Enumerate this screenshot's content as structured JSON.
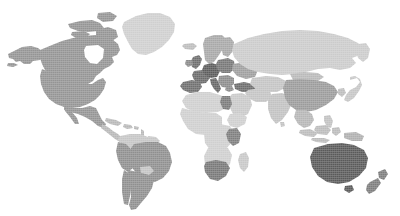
{
  "map": {
    "title": "",
    "projection": "equirectangular",
    "background_color": "#ffffff",
    "texture": "halftone-dither",
    "legend_visible": false,
    "labels_visible": false,
    "border_color": "none",
    "shade_levels": [
      {
        "key": "none",
        "color": "#ffffff",
        "label": "no data"
      },
      {
        "key": "light",
        "color": "#d2d2d2",
        "label": "lowest"
      },
      {
        "key": "medium",
        "color": "#b4b4b4",
        "label": "low"
      },
      {
        "key": "mid_dark",
        "color": "#969696",
        "label": "medium"
      },
      {
        "key": "dark",
        "color": "#7a7a7a",
        "label": "high"
      },
      {
        "key": "darkest",
        "color": "#5e5e5e",
        "label": "highest"
      }
    ],
    "regions": [
      {
        "name": "greenland",
        "shade": "#cfcfcf"
      },
      {
        "name": "canada",
        "shade": "#949494"
      },
      {
        "name": "united-states",
        "shade": "#949494"
      },
      {
        "name": "alaska",
        "shade": "#949494"
      },
      {
        "name": "mexico",
        "shade": "#949494"
      },
      {
        "name": "central-america",
        "shade": "#b8b8b8"
      },
      {
        "name": "caribbean",
        "shade": "#b8b8b8"
      },
      {
        "name": "colombia-venezuela",
        "shade": "#c6c6c6"
      },
      {
        "name": "brazil",
        "shade": "#8f8f8f"
      },
      {
        "name": "peru-bolivia",
        "shade": "#8f8f8f"
      },
      {
        "name": "paraguay",
        "shade": "#c4c4c4"
      },
      {
        "name": "argentina-chile",
        "shade": "#8f8f8f"
      },
      {
        "name": "iceland",
        "shade": "#bdbdbd"
      },
      {
        "name": "scandinavia",
        "shade": "#a8a8a8"
      },
      {
        "name": "united-kingdom",
        "shade": "#6e6e6e"
      },
      {
        "name": "ireland",
        "shade": "#8a8a8a"
      },
      {
        "name": "france",
        "shade": "#6b6b6b"
      },
      {
        "name": "spain-portugal",
        "shade": "#6f6f6f"
      },
      {
        "name": "germany",
        "shade": "#5c5c5c"
      },
      {
        "name": "poland-baltics",
        "shade": "#777777"
      },
      {
        "name": "italy",
        "shade": "#666666"
      },
      {
        "name": "balkans",
        "shade": "#8c8c8c"
      },
      {
        "name": "turkey",
        "shade": "#6d6d6d"
      },
      {
        "name": "ukraine-belarus",
        "shade": "#9e9e9e"
      },
      {
        "name": "russia",
        "shade": "#cbcbcb"
      },
      {
        "name": "north-africa",
        "shade": "#cfcfcf"
      },
      {
        "name": "egypt",
        "shade": "#7b7b7b"
      },
      {
        "name": "sub-saharan-africa",
        "shade": "#cfcfcf"
      },
      {
        "name": "kenya-tanzania",
        "shade": "#7e7e7e"
      },
      {
        "name": "south-africa",
        "shade": "#787878"
      },
      {
        "name": "madagascar",
        "shade": "#c8c8c8"
      },
      {
        "name": "arabian-peninsula",
        "shade": "#c9c9c9"
      },
      {
        "name": "iran-central-asia",
        "shade": "#c4c4c4"
      },
      {
        "name": "india",
        "shade": "#c2c2c2"
      },
      {
        "name": "china",
        "shade": "#9b9b9b"
      },
      {
        "name": "mongolia",
        "shade": "#b9b9b9"
      },
      {
        "name": "southeast-asia",
        "shade": "#b6b6b6"
      },
      {
        "name": "indonesia",
        "shade": "#bcbcbc"
      },
      {
        "name": "japan",
        "shade": "#c6c6c6"
      },
      {
        "name": "korea",
        "shade": "#bdbdbd"
      },
      {
        "name": "philippines",
        "shade": "#c2c2c2"
      },
      {
        "name": "papua-new-guinea",
        "shade": "#b0b0b0"
      },
      {
        "name": "australia",
        "shade": "#5a5a5a"
      },
      {
        "name": "new-zealand",
        "shade": "#7d7d7d"
      }
    ]
  }
}
